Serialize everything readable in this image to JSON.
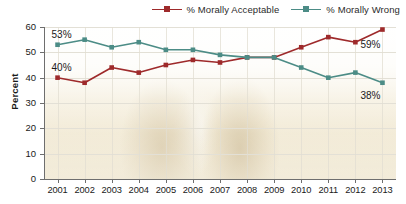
{
  "chart_data": {
    "type": "line",
    "title": "",
    "xlabel": "",
    "ylabel": "Percent",
    "ylim": [
      0,
      60
    ],
    "yticks": [
      0,
      10,
      20,
      30,
      40,
      50,
      60
    ],
    "grid": true,
    "legend_position": "top-right",
    "categories": [
      "2001",
      "2002",
      "2003",
      "2004",
      "2005",
      "2006",
      "2007",
      "2008",
      "2009",
      "2010",
      "2011",
      "2012",
      "2013"
    ],
    "series": [
      {
        "name": "% Morally Acceptable",
        "color": "#9e2a2b",
        "values": [
          40,
          38,
          44,
          42,
          45,
          47,
          46,
          48,
          48,
          52,
          56,
          54,
          59
        ]
      },
      {
        "name": "% Morally Wrong",
        "color": "#4c8c86",
        "values": [
          53,
          55,
          52,
          54,
          51,
          51,
          49,
          48,
          48,
          44,
          40,
          42,
          38
        ]
      }
    ],
    "annotations": [
      {
        "text": "53%",
        "series": "% Morally Wrong",
        "category": "2001"
      },
      {
        "text": "40%",
        "series": "% Morally Acceptable",
        "category": "2001"
      },
      {
        "text": "59%",
        "series": "% Morally Acceptable",
        "category": "2013"
      },
      {
        "text": "38%",
        "series": "% Morally Wrong",
        "category": "2013"
      }
    ]
  },
  "legend": {
    "items": [
      {
        "label": "% Morally Acceptable",
        "color": "#9e2a2b"
      },
      {
        "label": "% Morally Wrong",
        "color": "#4c8c86"
      }
    ]
  },
  "axes": {
    "y_title": "Percent",
    "y_labels": [
      "60",
      "50",
      "40",
      "30",
      "20",
      "10",
      "0"
    ],
    "x_labels": [
      "2001",
      "2002",
      "2003",
      "2004",
      "2005",
      "2006",
      "2007",
      "2008",
      "2009",
      "2010",
      "2011",
      "2012",
      "2013"
    ]
  },
  "annotations": {
    "left_wrong": "53%",
    "left_acceptable": "40%",
    "right_acceptable": "59%",
    "right_wrong": "38%"
  }
}
